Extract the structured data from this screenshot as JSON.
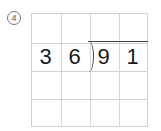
{
  "problem": {
    "number_label": "4",
    "divisor": [
      "3",
      "6"
    ],
    "dividend": [
      "9",
      "1"
    ],
    "grid": {
      "rows": 4,
      "columns": 4
    }
  }
}
